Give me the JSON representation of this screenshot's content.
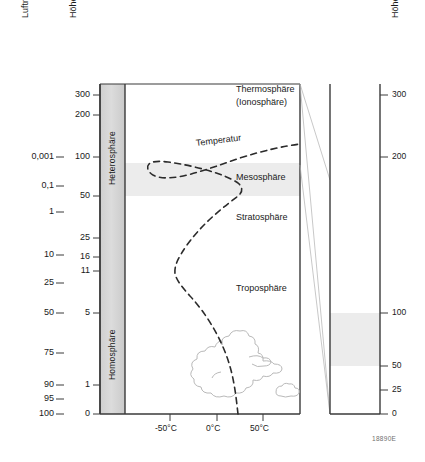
{
  "figure": {
    "code": "18890E",
    "left_axis_title": "Luftmasse (%)",
    "height_axis_title": "Höhe km",
    "right_axis_title": "Höhe km"
  },
  "air_mass_axis": {
    "title": "Luftmasse (%)",
    "ticks": [
      {
        "label": "0,001",
        "y": 157
      },
      {
        "label": "0,1",
        "y": 186
      },
      {
        "label": "1",
        "y": 212
      },
      {
        "label": "10",
        "y": 255
      },
      {
        "label": "25",
        "y": 283
      },
      {
        "label": "50",
        "y": 313
      },
      {
        "label": "75",
        "y": 353
      },
      {
        "label": "90",
        "y": 385
      },
      {
        "label": "95",
        "y": 399
      },
      {
        "label": "100",
        "y": 414
      }
    ]
  },
  "height_axis": {
    "title": "Höhe km",
    "ticks": [
      {
        "label": "300",
        "y": 95
      },
      {
        "label": "200",
        "y": 115
      },
      {
        "label": "100",
        "y": 157
      },
      {
        "label": "50",
        "y": 196
      },
      {
        "label": "25",
        "y": 238
      },
      {
        "label": "16",
        "y": 257
      },
      {
        "label": "11",
        "y": 271
      },
      {
        "label": "5",
        "y": 313
      },
      {
        "label": "1",
        "y": 385
      },
      {
        "label": "0",
        "y": 414
      }
    ]
  },
  "right_axis": {
    "title": "Höhe km",
    "ticks": [
      {
        "label": "300",
        "y": 95
      },
      {
        "label": "200",
        "y": 157
      },
      {
        "label": "100",
        "y": 313
      },
      {
        "label": "50",
        "y": 366
      },
      {
        "label": "25",
        "y": 390
      },
      {
        "label": "0",
        "y": 414
      }
    ]
  },
  "sphere_bands": [
    {
      "name": "heterosphere",
      "label": "Heterosphäre",
      "y_center": 140
    },
    {
      "name": "homosphere",
      "label": "Homosphäre",
      "y_center": 340
    }
  ],
  "atmosphere_layers": [
    {
      "name": "thermosphere",
      "label": "Thermosphäre",
      "sublabel": "(Ionosphäre)",
      "x": 236,
      "y": 91
    },
    {
      "name": "mesosphere",
      "label": "Mesosphäre",
      "sublabel": "",
      "x": 236,
      "y": 178
    },
    {
      "name": "stratosphere",
      "label": "Stratosphäre",
      "sublabel": "",
      "x": 236,
      "y": 218
    },
    {
      "name": "troposphere",
      "label": "Troposphäre",
      "sublabel": "",
      "x": 236,
      "y": 289
    }
  ],
  "temperature_curve": {
    "label": "Temperatur",
    "label_x": 228,
    "label_y": 142,
    "style": "dashed"
  },
  "temperature_axis": {
    "ticks": [
      {
        "label": "-50°C",
        "x": 170
      },
      {
        "label": "0°C",
        "x": 217
      },
      {
        "label": "50°C",
        "x": 263
      }
    ]
  },
  "colors": {
    "band_grey": "#d9d9d9",
    "highlight_grey": "#ececec",
    "axis_line": "#3a3a3a",
    "curve": "#2b2b2b",
    "cloud_outline": "#b9b9b9"
  }
}
